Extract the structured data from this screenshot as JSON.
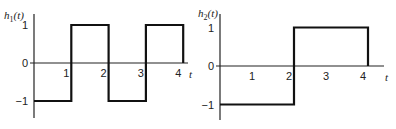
{
  "chart_data": [
    {
      "type": "line",
      "title": "h1(t)",
      "title_base": "h",
      "title_sub": "1",
      "title_arg": "(t)",
      "xlabel": "t",
      "ylabel": "h1(t)",
      "xticks": [
        "1",
        "2",
        "3",
        "4"
      ],
      "xtick_values": [
        1,
        2,
        3,
        4
      ],
      "yticks": [
        "1",
        "0",
        "−1"
      ],
      "ytick_values": [
        1,
        0,
        -1
      ],
      "xlim": [
        0,
        4.3
      ],
      "ylim": [
        -1.4,
        1.2
      ],
      "x": [
        0,
        1,
        1,
        2,
        2,
        3,
        3,
        4,
        4
      ],
      "y": [
        -1,
        -1,
        1,
        1,
        -1,
        -1,
        1,
        1,
        0
      ]
    },
    {
      "type": "line",
      "title": "h2(t)",
      "title_base": "h",
      "title_sub": "2",
      "title_arg": "(t)",
      "xlabel": "t",
      "ylabel": "h2(t)",
      "xticks": [
        "1",
        "2",
        "3",
        "4"
      ],
      "xtick_values": [
        1,
        2,
        3,
        4
      ],
      "yticks": [
        "1",
        "0",
        "−1"
      ],
      "ytick_values": [
        1,
        0,
        -1
      ],
      "xlim": [
        0,
        4.3
      ],
      "ylim": [
        -1.4,
        1.2
      ],
      "x": [
        0,
        2,
        2,
        4,
        4
      ],
      "y": [
        -1,
        -1,
        1,
        1,
        0
      ]
    }
  ]
}
